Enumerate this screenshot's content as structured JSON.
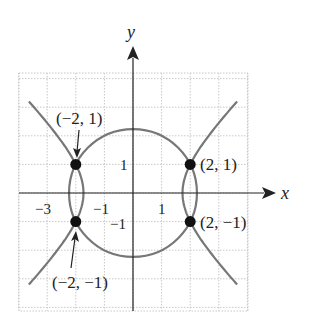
{
  "axes": {
    "x_label": "x",
    "y_label": "y",
    "x_ticks": [
      {
        "value": -3,
        "label": "−3"
      },
      {
        "value": -1,
        "label": "−1"
      },
      {
        "value": 1,
        "label": "1"
      }
    ],
    "y_ticks": [
      {
        "value": 1,
        "label": "1"
      },
      {
        "value": -1,
        "label": "−1"
      }
    ]
  },
  "curves": [
    {
      "name": "circle",
      "equation": "x^2 + y^2 = 5"
    },
    {
      "name": "hyperbola",
      "equation": "x^2 - y^2 = 3"
    }
  ],
  "points": [
    {
      "x": -2,
      "y": 1,
      "label": "(−2, 1)"
    },
    {
      "x": 2,
      "y": 1,
      "label": "(2, 1)"
    },
    {
      "x": -2,
      "y": -1,
      "label": "(−2, −1)"
    },
    {
      "x": 2,
      "y": -1,
      "label": "(2, −1)"
    }
  ],
  "colors": {
    "curve": "#777777",
    "grid": "#c8c8c8",
    "axis": "#222222",
    "point": "#111111"
  }
}
